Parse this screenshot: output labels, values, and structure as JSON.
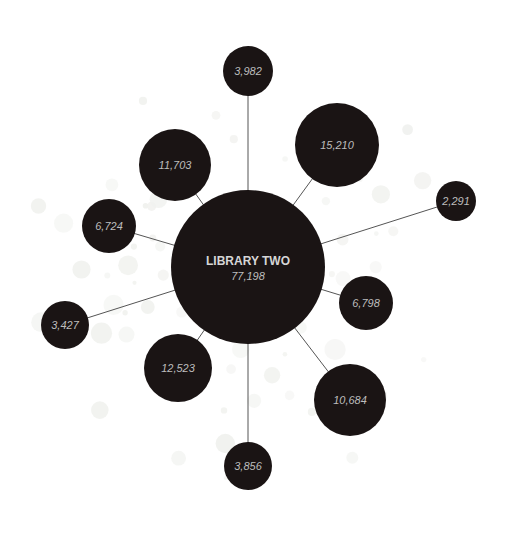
{
  "diagram": {
    "type": "hub-and-spoke bubble diagram",
    "colors": {
      "background": "#ffffff",
      "node_fill": "#1a1414",
      "spoke": "#555555",
      "label": "#bdbdbd",
      "hub_title": "#d6d6d6",
      "decor_dot": "#f1f2ef"
    },
    "hub": {
      "title": "LIBRARY TWO",
      "value": "77,198",
      "cx": 248,
      "cy": 267,
      "r": 77
    },
    "nodes": [
      {
        "value": "3,982",
        "cx": 248,
        "cy": 71,
        "r": 25
      },
      {
        "value": "15,210",
        "cx": 337,
        "cy": 145,
        "r": 42
      },
      {
        "value": "2,291",
        "cx": 456,
        "cy": 201,
        "r": 20
      },
      {
        "value": "6,798",
        "cx": 366,
        "cy": 303,
        "r": 27
      },
      {
        "value": "10,684",
        "cx": 350,
        "cy": 400,
        "r": 36
      },
      {
        "value": "3,856",
        "cx": 248,
        "cy": 466,
        "r": 24
      },
      {
        "value": "12,523",
        "cx": 178,
        "cy": 368,
        "r": 34
      },
      {
        "value": "3,427",
        "cx": 65,
        "cy": 325,
        "r": 24
      },
      {
        "value": "6,724",
        "cx": 109,
        "cy": 226,
        "r": 27
      },
      {
        "value": "11,703",
        "cx": 175,
        "cy": 165,
        "r": 36
      }
    ]
  }
}
